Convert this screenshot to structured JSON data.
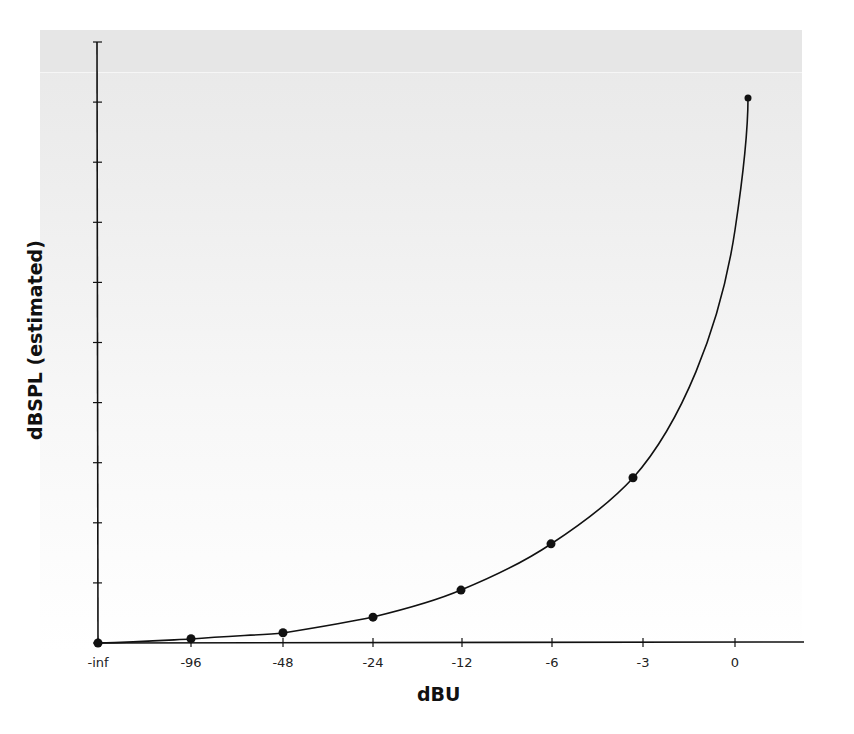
{
  "chart_data": {
    "type": "line",
    "title": "",
    "xlabel": "dBU",
    "ylabel": "dBSPL (estimated)",
    "x_tick_labels": [
      "-inf",
      "-96",
      "-48",
      "-24",
      "-12",
      "-6",
      "-3",
      "0"
    ],
    "y_tick_labels": [],
    "y_tick_count": 11,
    "grid": false,
    "legend": null,
    "series": [
      {
        "name": "dBSPL vs dBU",
        "markers": true,
        "points": [
          {
            "x": "-inf",
            "y_rel": 0.0
          },
          {
            "x": "-96",
            "y_rel": 0.007
          },
          {
            "x": "-48",
            "y_rel": 0.017
          },
          {
            "x": "-24",
            "y_rel": 0.043
          },
          {
            "x": "-12",
            "y_rel": 0.088
          },
          {
            "x": "-6",
            "y_rel": 0.165
          },
          {
            "x": "-3",
            "y_rel": 0.275
          },
          {
            "x": "+1 (approx)",
            "y_rel": 0.907
          }
        ]
      }
    ]
  },
  "axes": {
    "x_label": "dBU",
    "y_label": "dBSPL (estimated)",
    "x_ticks": [
      {
        "label": "-inf",
        "px": 98
      },
      {
        "label": "-96",
        "px": 191
      },
      {
        "label": "-48",
        "px": 283
      },
      {
        "label": "-24",
        "px": 373
      },
      {
        "label": "-12",
        "px": 462
      },
      {
        "label": "-6",
        "px": 552
      },
      {
        "label": "-3",
        "px": 643
      },
      {
        "label": "0",
        "px": 735
      }
    ]
  }
}
